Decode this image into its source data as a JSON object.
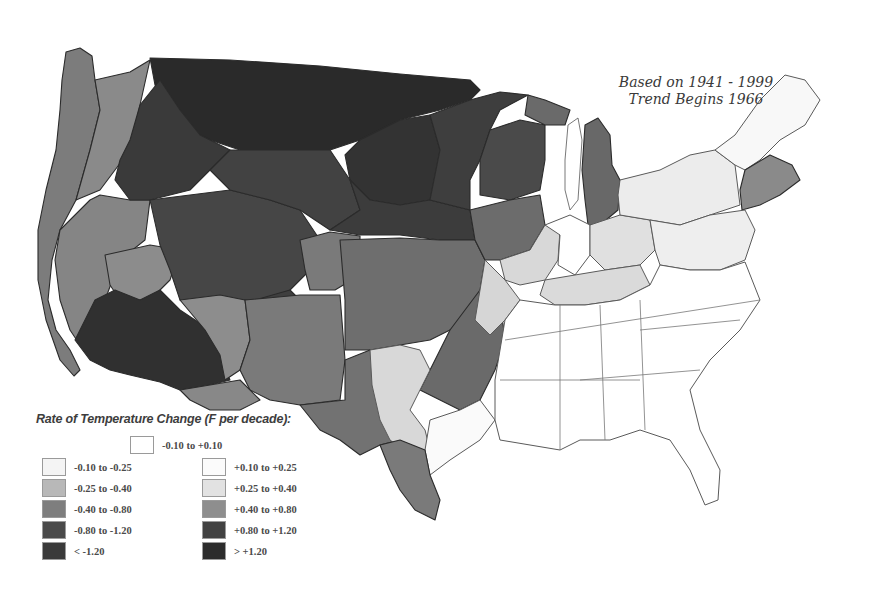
{
  "figure": {
    "type": "choropleth-map",
    "annotation": {
      "line1": "Based on 1941 - 1999",
      "line2": "Trend Begins 1966"
    }
  },
  "legend": {
    "title": "Rate of Temperature Change (F  per decade):",
    "neutral": {
      "label": "-0.10 to +0.10",
      "color": "#ffffff"
    },
    "cooling": [
      {
        "label": "-0.10 to -0.25",
        "color": "#f4f4f4"
      },
      {
        "label": "-0.25 to -0.40",
        "color": "#b8b8b8"
      },
      {
        "label": "-0.40 to -0.80",
        "color": "#7e7e7e"
      },
      {
        "label": "-0.80 to -1.20",
        "color": "#4a4a4a"
      },
      {
        "label": "< -1.20",
        "color": "#3a3a3a"
      }
    ],
    "warming": [
      {
        "label": "+0.10 to +0.25",
        "color": "#fbfbfb"
      },
      {
        "label": "+0.25 to +0.40",
        "color": "#e2e2e2"
      },
      {
        "label": "+0.40 to +0.80",
        "color": "#8e8e8e"
      },
      {
        "label": "+0.80 to +1.20",
        "color": "#424242"
      },
      {
        "label": "> +1.20",
        "color": "#2c2c2c"
      }
    ]
  },
  "regions": {
    "northern_plains": {
      "class": "> +1.20",
      "color": "#2a2a2a"
    },
    "northwest_interior": {
      "class": "+0.80 to +1.20",
      "color": "#444444"
    },
    "central_rockies": {
      "class": "+0.80 to +1.20",
      "color": "#464646"
    },
    "desert_southwest": {
      "class": "> +1.20",
      "color": "#303030"
    },
    "pacific_coast": {
      "class": "+0.40 to +0.80",
      "color": "#7c7c7c"
    },
    "southern_plains": {
      "class": "+0.40 to +0.80",
      "color": "#6e6e6e"
    },
    "upper_midwest": {
      "class": "+0.80 to +1.20",
      "color": "#3e3e3e"
    },
    "michigan": {
      "class": "+0.40 to +0.80",
      "color": "#686868"
    },
    "ohio_valley": {
      "class": "+0.25 to +0.40",
      "color": "#dcdcdc"
    },
    "northeast": {
      "class": "+0.10 to +0.40",
      "color": "#ececec"
    },
    "new_england_south": {
      "class": "+0.40 to +0.80",
      "color": "#8a8a8a"
    },
    "southeast": {
      "class": "-0.10 to +0.10",
      "color": "#ffffff"
    },
    "central_texas": {
      "class": "+0.25 to +0.40",
      "color": "#d8d8d8"
    },
    "south_texas": {
      "class": "+0.40 to +0.80",
      "color": "#7a7a7a"
    }
  }
}
